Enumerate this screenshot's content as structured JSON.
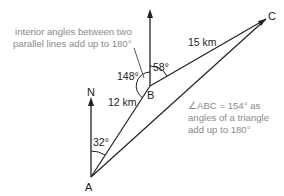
{
  "diagram": {
    "points": {
      "A": "A",
      "B": "B",
      "C": "C"
    },
    "north_label": "N",
    "distances": {
      "AB": "12 km",
      "BC": "15 km"
    },
    "angles": {
      "bearing_A": "32°",
      "interior_B": "148°",
      "bearing_B": "58°"
    },
    "annotations": {
      "parallel_note_line1": "interior angles between two",
      "parallel_note_line2": "parallel lines add up to 180°",
      "triangle_note_line1": "∠ABC = 154° as",
      "triangle_note_line2": "angles of a triangle",
      "triangle_note_line3": "add up to 180°"
    },
    "colors": {
      "line": "#222222",
      "annotation": "#8a8a8a"
    }
  }
}
